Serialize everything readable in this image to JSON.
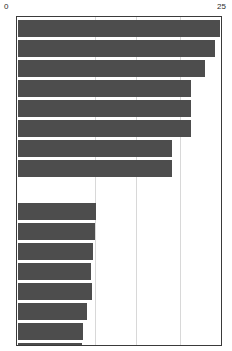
{
  "chart": {
    "type": "bar",
    "orientation": "horizontal",
    "title": "",
    "bar_color": "#4d4d4d",
    "frame_color": "#3a3a3a",
    "grid_color": "#d8d8d8",
    "background": "#ffffff"
  },
  "axis": {
    "min_label": "0",
    "max_label": "25",
    "position": "top"
  },
  "chart_data": {
    "type": "bar",
    "orientation": "horizontal",
    "title": "",
    "xlabel": "",
    "ylabel": "",
    "xlim": [
      0,
      25
    ],
    "xticks": [
      0,
      25
    ],
    "xtick_labels": [
      "0",
      "25"
    ],
    "grid": true,
    "gridline_values": [
      9.6,
      14.6,
      20.0
    ],
    "legend": "none",
    "categories": [
      "bar-1",
      "bar-2",
      "bar-3",
      "bar-4",
      "bar-5",
      "bar-6",
      "bar-7",
      "bar-8",
      "bar-9",
      "bar-10",
      "bar-11",
      "bar-12",
      "bar-13",
      "bar-14",
      "bar-15",
      "bar-16"
    ],
    "values": [
      24.7,
      24.2,
      22.9,
      21.2,
      21.2,
      21.2,
      18.9,
      18.9,
      9.6,
      9.4,
      9.2,
      9.0,
      9.1,
      8.4,
      8.0,
      7.9
    ],
    "groups": [
      {
        "name": "upper-group",
        "values": [
          24.7,
          24.2,
          22.9,
          21.2,
          21.2,
          21.2,
          18.9,
          18.9
        ]
      },
      {
        "name": "lower-group",
        "values": [
          9.6,
          9.4,
          9.2,
          9.0,
          9.1,
          8.4,
          8.0,
          7.9
        ]
      }
    ]
  }
}
